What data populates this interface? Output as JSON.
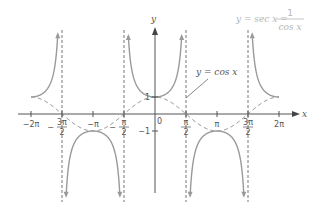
{
  "chart_data": {
    "type": "line",
    "title_parts": {
      "lhs": "y = sec x =",
      "numerator": "1",
      "denominator": "cos x"
    },
    "xlabel": "x",
    "ylabel": "y",
    "xlim": [
      -6.283,
      6.283
    ],
    "ylim": [
      -5,
      5
    ],
    "grid": false,
    "origin_label": "0",
    "x_ticks": [
      {
        "value": -6.2832,
        "label": "−2π",
        "frac": false
      },
      {
        "value": -4.7124,
        "label_num": "3π",
        "label_den": "2",
        "sign": "−",
        "frac": true
      },
      {
        "value": -3.1416,
        "label": "−π",
        "frac": false
      },
      {
        "value": -1.5708,
        "label_num": "π",
        "label_den": "2",
        "sign": "−",
        "frac": true
      },
      {
        "value": 1.5708,
        "label_num": "π",
        "label_den": "2",
        "sign": "",
        "frac": true
      },
      {
        "value": 3.1416,
        "label": "π",
        "frac": false
      },
      {
        "value": 4.7124,
        "label_num": "3π",
        "label_den": "2",
        "sign": "",
        "frac": true
      },
      {
        "value": 6.2832,
        "label": "2π",
        "frac": false
      }
    ],
    "y_ticks": [
      {
        "value": 1,
        "label": "1"
      },
      {
        "value": -1,
        "label": "−1"
      }
    ],
    "asymptotes": [
      -4.7124,
      -1.5708,
      1.5708,
      4.7124
    ],
    "series": [
      {
        "name": "y = sec x",
        "style": "solid",
        "function": "1/cos(x)"
      },
      {
        "name": "y = cos x",
        "style": "dashed",
        "function": "cos(x)"
      }
    ],
    "annotations": [
      {
        "text": "y = cos x",
        "points_to": [
          1.5,
          0.9
        ]
      }
    ]
  },
  "labels": {
    "x_axis": "x",
    "y_axis": "y",
    "origin": "0",
    "cos_label": "y = cos x",
    "title_lhs": "y = sec x =",
    "title_num": "1",
    "title_den": "cos x"
  }
}
